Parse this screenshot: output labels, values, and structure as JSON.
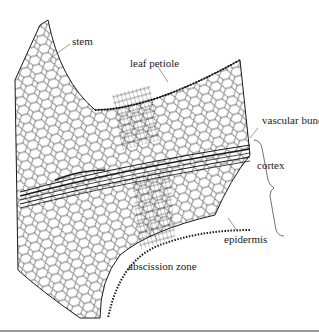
{
  "figure": {
    "labels": {
      "stem": "stem",
      "leaf_petiole": "leaf petiole",
      "vascular_bundle": "vascular bundle",
      "cortex": "cortex",
      "epidermis": "epidermis",
      "abscission_zone": "abscission zone"
    },
    "colors": {
      "ink": "#1a1a1a",
      "background": "#ffffff",
      "rule": "#9a9a9a"
    }
  }
}
